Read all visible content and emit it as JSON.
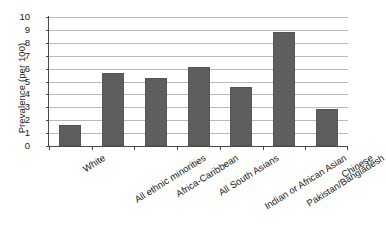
{
  "chart_data": {
    "type": "bar",
    "title": "",
    "xlabel": "",
    "ylabel": "Prevalence (per 100)",
    "ylim": [
      0,
      10
    ],
    "ytick_labels": [
      "10",
      "9",
      "8",
      "7",
      "6",
      "5",
      "4",
      "3",
      "2",
      "1",
      "0"
    ],
    "ytick_values": [
      10,
      9,
      8,
      7,
      6,
      5,
      4,
      3,
      2,
      1,
      0
    ],
    "grid": true,
    "legend": "none",
    "bar_color": "#5e5e5e",
    "categories": [
      "White",
      "All ethnic minorities",
      "Africa-Caribbean",
      "All South Asians",
      "Indian or African Asian",
      "Pakistan/Bangladesh",
      "Chinese"
    ],
    "values": [
      1.65,
      5.65,
      5.25,
      6.1,
      4.6,
      8.8,
      2.9
    ]
  }
}
